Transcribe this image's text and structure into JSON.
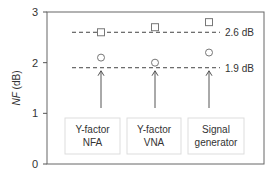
{
  "chart_data": {
    "type": "scatter",
    "title": "",
    "xlabel": "",
    "ylabel": "NF (dB)",
    "ylabel_italic_part": "NF",
    "ylabel_unit_part": " (dB)",
    "ylim": [
      0,
      3
    ],
    "yticks": [
      0,
      1,
      2,
      3
    ],
    "grid": false,
    "categories": [
      "Y-factor NFA",
      "Y-factor VNA",
      "Signal generator"
    ],
    "category_lines": [
      [
        "Y-factor",
        "NFA"
      ],
      [
        "Y-factor",
        "VNA"
      ],
      [
        "Signal",
        "generator"
      ]
    ],
    "series": [
      {
        "name": "square markers",
        "marker": "square",
        "values": [
          2.6,
          2.7,
          2.8
        ]
      },
      {
        "name": "circle markers",
        "marker": "circle",
        "values": [
          2.1,
          2.0,
          2.2
        ]
      }
    ],
    "reference_lines": [
      {
        "value": 2.6,
        "label": "2.6 dB",
        "style": "dashed"
      },
      {
        "value": 1.9,
        "label": "1.9 dB",
        "style": "dashed"
      }
    ],
    "annotations": "Upward arrows from each method box to the 1.9 dB line"
  },
  "colors": {
    "axis": "#555555",
    "marker": "#777777",
    "dash": "#444444",
    "box_border": "#dddddd"
  }
}
